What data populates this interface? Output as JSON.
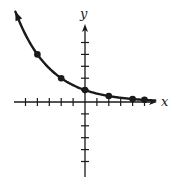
{
  "chart_data": {
    "type": "line",
    "title": "",
    "function": "y = (1/2)^(x/2)",
    "xlabel": "x",
    "ylabel": "y",
    "xlim": [
      -6,
      6
    ],
    "ylim": [
      -5,
      6
    ],
    "x_ticks": [
      -6,
      -5,
      -4,
      -3,
      -2,
      -1,
      1,
      2,
      3,
      4,
      5
    ],
    "y_ticks": [
      -5,
      -4,
      -3,
      -2,
      -1,
      1,
      2,
      3,
      4,
      5
    ],
    "tick_labels_shown": false,
    "grid": false,
    "curve_arrow_left": true,
    "x_axis_arrow_right": true,
    "y_axis_arrow_up": true,
    "series": [
      {
        "name": "exponential decay",
        "points": [
          {
            "x": -4,
            "y": 4
          },
          {
            "x": -2,
            "y": 2
          },
          {
            "x": 0,
            "y": 1
          },
          {
            "x": 2,
            "y": 0.5
          },
          {
            "x": 4,
            "y": 0.25
          },
          {
            "x": 5,
            "y": 0.18
          }
        ]
      }
    ],
    "colors": {
      "ink": "#1a1a1a",
      "background": "#ffffff"
    }
  }
}
